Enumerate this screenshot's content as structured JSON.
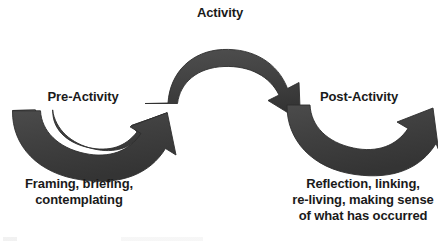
{
  "diagram": {
    "type": "process-cycle",
    "background_color": "#ffffff",
    "arrow_color": "#404040",
    "arrow_edge_color": "#2e2e2e",
    "text_color": "#1a1a1a",
    "title": "Activity",
    "stages": [
      {
        "id": "pre-activity",
        "label": "Pre-Activity",
        "description": "Framing, briefing,\ncontemplating"
      },
      {
        "id": "activity",
        "label": "Activity",
        "description": ""
      },
      {
        "id": "post-activity",
        "label": "Post-Activity",
        "description": "Reflection, linking,\nre-living, making sense\nof what has occurred"
      }
    ],
    "arrows": [
      {
        "id": "arrow-pre-to-activity",
        "from": "pre-activity",
        "to": "activity",
        "direction": "up-right",
        "shape": "curved-valley"
      },
      {
        "id": "arrow-activity-arch",
        "from": "activity",
        "to": "post-activity",
        "direction": "down-right",
        "shape": "curved-arch"
      },
      {
        "id": "arrow-post-onward",
        "from": "post-activity",
        "to": "",
        "direction": "up-right",
        "shape": "curved-valley"
      }
    ]
  }
}
